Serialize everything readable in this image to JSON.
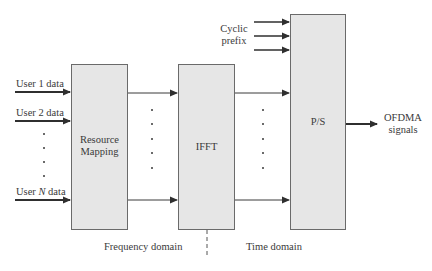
{
  "diagram": {
    "inputs": [
      {
        "label_prefix": "User ",
        "label_var": "1",
        "label_suffix": " data"
      },
      {
        "label_prefix": "User ",
        "label_var": "2",
        "label_suffix": " data"
      },
      {
        "label_prefix": "User ",
        "label_var": "N",
        "label_suffix": " data"
      }
    ],
    "blocks": {
      "resource_mapping": {
        "line1": "Resource",
        "line2": "Mapping"
      },
      "ifft": {
        "label": "IFFT"
      },
      "ps": {
        "label": "P/S"
      }
    },
    "cyclic_prefix": {
      "line1": "Cyclic",
      "line2": "prefix"
    },
    "output": {
      "line1": "OFDMA",
      "line2": "signals"
    },
    "domains": {
      "frequency": "Frequency domain",
      "time": "Time domain"
    },
    "colors": {
      "block_fill": "#e6e6e6",
      "block_stroke": "#6a6a6a",
      "line": "#3a3a3a"
    }
  }
}
